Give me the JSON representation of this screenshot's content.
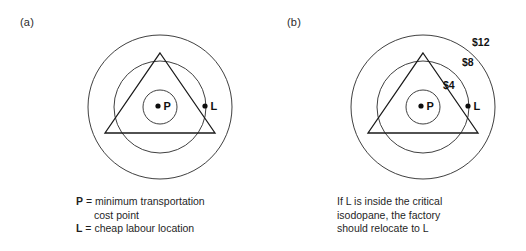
{
  "figure": {
    "panels": [
      {
        "tag": "(a)",
        "diagram": {
          "center": {
            "x": 160,
            "y": 107
          },
          "circles": [
            {
              "name": "outer-isodapane",
              "r": 72,
              "label": ""
            },
            {
              "name": "middle-isodapane",
              "r": 46,
              "label": ""
            },
            {
              "name": "inner-isodapane",
              "r": 17,
              "label": ""
            }
          ],
          "triangle": {
            "apex": {
              "x": 160,
              "y": 53
            },
            "left": {
              "x": 105,
              "y": 133
            },
            "right": {
              "x": 215,
              "y": 133
            }
          },
          "points": [
            {
              "id": "P",
              "label": "P",
              "x": 158,
              "y": 106
            },
            {
              "id": "L",
              "label": "L",
              "x": 205,
              "y": 106
            }
          ]
        },
        "caption": {
          "lines": [
            {
              "key": "P",
              "sep": " = ",
              "text": "minimum transportation"
            },
            {
              "key": "",
              "sep": "",
              "text": "cost point"
            },
            {
              "key": "L",
              "sep": " = ",
              "text": "cheap labour location"
            }
          ]
        }
      },
      {
        "tag": "(b)",
        "diagram": {
          "center": {
            "x": 160,
            "y": 107
          },
          "circles": [
            {
              "name": "outer-isodapane",
              "r": 72,
              "label": "$12"
            },
            {
              "name": "middle-isodapane",
              "r": 46,
              "label": "$8"
            },
            {
              "name": "inner-isodapane",
              "r": 17,
              "label": "$4"
            }
          ],
          "triangle": {
            "apex": {
              "x": 160,
              "y": 53
            },
            "left": {
              "x": 105,
              "y": 133
            },
            "right": {
              "x": 215,
              "y": 133
            }
          },
          "points": [
            {
              "id": "P",
              "label": "P",
              "x": 158,
              "y": 106
            },
            {
              "id": "L",
              "label": "L",
              "x": 205,
              "y": 106
            }
          ],
          "money_labels": [
            {
              "text": "$12",
              "x": 209,
              "y": 46
            },
            {
              "text": "$8",
              "x": 199,
              "y": 66
            },
            {
              "text": "$4",
              "x": 180,
              "y": 89
            }
          ]
        },
        "caption": {
          "lines": [
            {
              "key": "",
              "sep": "",
              "text": "If L is inside the critical"
            },
            {
              "key": "",
              "sep": "",
              "text": "isodopane, the factory"
            },
            {
              "key": "",
              "sep": "",
              "text": "should relocate to L"
            }
          ]
        }
      }
    ],
    "colors": {
      "background": "#ffffff",
      "stroke": "#2a2a2a",
      "text": "#1a1a1a"
    }
  }
}
